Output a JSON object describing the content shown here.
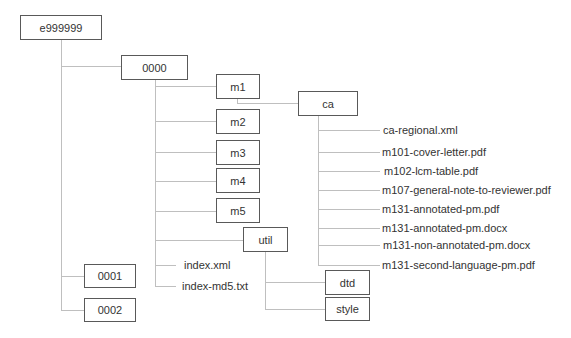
{
  "tree": {
    "root": "e999999",
    "sequences": [
      "0000",
      "0001",
      "0002"
    ],
    "modules": [
      "m1",
      "m2",
      "m3",
      "m4",
      "m5"
    ],
    "region": "ca",
    "util": "util",
    "util_children": [
      "dtd",
      "style"
    ],
    "seq_files": [
      "index.xml",
      "index-md5.txt"
    ],
    "ca_files": [
      "ca-regional.xml",
      "m101-cover-letter.pdf",
      "m102-lcm-table.pdf",
      "m107-general-note-to-reviewer.pdf",
      "m131-annotated-pm.pdf",
      "m131-annotated-pm.docx",
      "m131-non-annotated-pm.docx",
      "m131-second-language-pm.pdf"
    ]
  },
  "colors": {
    "box_border": "#595959",
    "connector": "#bfbfbf",
    "text": "#333333"
  }
}
